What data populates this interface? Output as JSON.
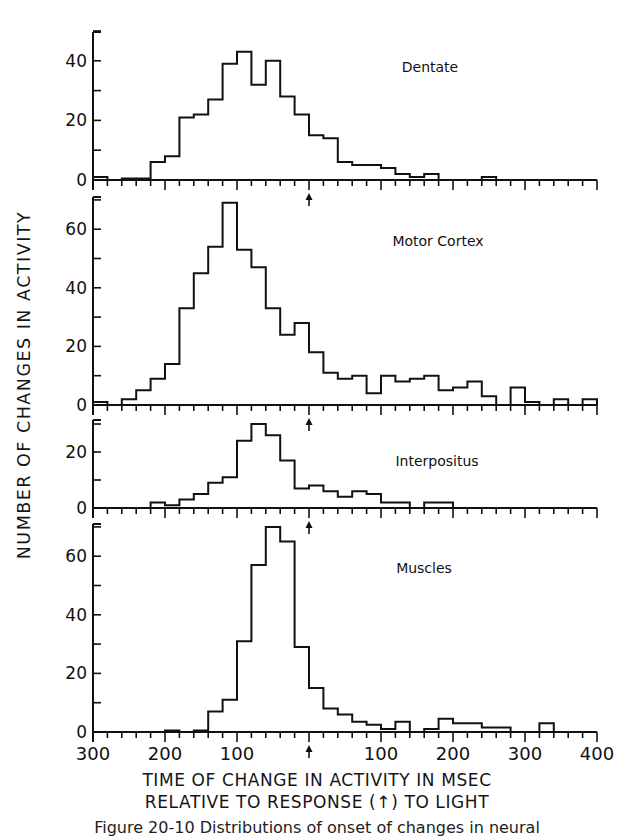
{
  "figure": {
    "y_axis_label": "NUMBER OF CHANGES IN ACTIVITY",
    "x_axis_label_line1": "TIME OF CHANGE IN ACTIVITY IN MSEC",
    "x_axis_label_line2": "RELATIVE TO RESPONSE (↑) TO LIGHT",
    "caption_partial": "Figure 20-10 Distributions of onset of changes in neural"
  },
  "chart_data": {
    "type": "bar",
    "subtype": "step-histogram, 4 stacked panels sharing x-axis",
    "xlabel": "TIME OF CHANGE IN ACTIVITY IN MSEC RELATIVE TO RESPONSE (↑) TO LIGHT",
    "ylabel": "NUMBER OF CHANGES IN ACTIVITY",
    "x_range": [
      -300,
      400
    ],
    "x_tick_labels": [
      "300",
      "200",
      "100",
      "↑",
      "100",
      "200",
      "300",
      "400"
    ],
    "x_tick_values": [
      -300,
      -200,
      -100,
      0,
      100,
      200,
      300,
      400
    ],
    "bin_width_ms": 20,
    "bin_starts": [
      -300,
      -280,
      -260,
      -240,
      -220,
      -200,
      -180,
      -160,
      -140,
      -120,
      -100,
      -80,
      -60,
      -40,
      -20,
      0,
      20,
      40,
      60,
      80,
      100,
      120,
      140,
      160,
      180,
      200,
      220,
      240,
      260,
      280,
      300,
      320,
      340,
      360,
      380
    ],
    "response_marker_x": 0,
    "grid": false,
    "panels": [
      {
        "name": "Dentate",
        "ylim": [
          0,
          50
        ],
        "y_ticks": [
          0,
          20,
          40
        ],
        "y_minor_ticks": [
          10,
          30,
          50
        ],
        "values": [
          1,
          0,
          0.5,
          0.5,
          6,
          8,
          21,
          22,
          27,
          39,
          43,
          32,
          40,
          28,
          22,
          15,
          14,
          6,
          5,
          5,
          4,
          2,
          1,
          2,
          0,
          0,
          0,
          1,
          0,
          0,
          0,
          0,
          0,
          0,
          0
        ]
      },
      {
        "name": "Motor Cortex",
        "ylim": [
          0,
          70
        ],
        "y_ticks": [
          0,
          20,
          40,
          60
        ],
        "y_minor_ticks": [
          10,
          30,
          50,
          70
        ],
        "values": [
          1,
          0,
          2,
          5,
          9,
          14,
          33,
          45,
          54,
          69,
          53,
          47,
          33,
          24,
          28,
          18,
          11,
          9,
          10,
          4,
          10,
          8,
          9,
          10,
          5,
          6,
          8,
          3,
          0,
          6,
          1,
          0,
          2,
          0,
          2
        ]
      },
      {
        "name": "Interpositus",
        "ylim": [
          0,
          30
        ],
        "y_ticks": [
          0,
          20
        ],
        "y_minor_ticks": [
          10,
          30
        ],
        "values": [
          0,
          0,
          0,
          0,
          2,
          1,
          3,
          5,
          9,
          11,
          24,
          30,
          26,
          17,
          7,
          8,
          6,
          4,
          6,
          5,
          2,
          2,
          0,
          2,
          2,
          0,
          0,
          0,
          0,
          0,
          0,
          0,
          0,
          0,
          0
        ]
      },
      {
        "name": "Muscles",
        "ylim": [
          0,
          70
        ],
        "y_ticks": [
          0,
          20,
          40,
          60
        ],
        "y_minor_ticks": [
          10,
          30,
          50,
          70
        ],
        "values": [
          0,
          0,
          0,
          0,
          0,
          0.5,
          0,
          0.5,
          7,
          11,
          31,
          57,
          70,
          65,
          29,
          15,
          8,
          6,
          3.5,
          2.5,
          1,
          3.5,
          0,
          1,
          4.5,
          3,
          3,
          1.5,
          1.5,
          0,
          0,
          3,
          0,
          0,
          0
        ]
      }
    ],
    "annotations": [
      "Dentate",
      "Motor Cortex",
      "Interpositus",
      "Muscles",
      "↑ (response marker at 0 ms)"
    ]
  },
  "layout": {
    "x0_px": 93,
    "px_per_ms": 0.72,
    "panels_px": [
      {
        "baseline_y": 180,
        "px_per_unit": 2.98,
        "top_y": 32,
        "label_x": 430,
        "label_y": 72
      },
      {
        "baseline_y": 405,
        "px_per_unit": 2.93,
        "top_y": 197,
        "label_x": 438,
        "label_y": 246
      },
      {
        "baseline_y": 508,
        "px_per_unit": 2.8,
        "top_y": 420,
        "label_x": 437,
        "label_y": 466
      },
      {
        "baseline_y": 732,
        "px_per_unit": 2.93,
        "top_y": 524,
        "label_x": 424,
        "label_y": 573
      }
    ],
    "line_color": "#111111"
  }
}
